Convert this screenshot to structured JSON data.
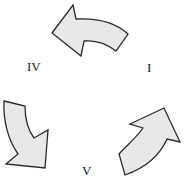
{
  "diagram": {
    "type": "cycle",
    "nodes": [
      {
        "id": "I",
        "label": "I"
      },
      {
        "id": "IV",
        "label": "IV"
      },
      {
        "id": "V",
        "label": "V"
      }
    ],
    "edges": [
      {
        "from": "I",
        "to": "IV",
        "style": "curved-block-arrow"
      },
      {
        "from": "IV",
        "to": "V",
        "style": "curved-block-arrow"
      },
      {
        "from": "V",
        "to": "I",
        "style": "curved-block-arrow"
      }
    ],
    "colors": {
      "arrow_fill": "#e8e8e8",
      "arrow_stroke": "#2a2a2a",
      "text": "#222222"
    }
  }
}
